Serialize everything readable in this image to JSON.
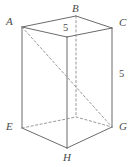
{
  "figure": {
    "type": "rectangular-prism-oblique-view",
    "vertices": [
      {
        "id": "A",
        "label": "A",
        "role": "top-left",
        "px": 22,
        "py": 27,
        "label_x": 6,
        "label_y": 16,
        "hidden": false
      },
      {
        "id": "B",
        "label": "B",
        "role": "top-back",
        "px": 76,
        "py": 16,
        "label_x": 72,
        "label_y": 3,
        "hidden": false
      },
      {
        "id": "C",
        "label": "C",
        "role": "top-right",
        "px": 112,
        "py": 28,
        "label_x": 119,
        "label_y": 17,
        "hidden": false
      },
      {
        "id": "D",
        "label": "",
        "role": "top-front",
        "px": 67,
        "py": 37,
        "label_x": 0,
        "label_y": 0,
        "hidden": false
      },
      {
        "id": "E",
        "label": "E",
        "role": "bottom-left",
        "px": 22,
        "py": 128,
        "label_x": 6,
        "label_y": 121,
        "hidden": false
      },
      {
        "id": "F",
        "label": "",
        "role": "bottom-back",
        "px": 76,
        "py": 117,
        "label_x": 0,
        "label_y": 0,
        "hidden": true
      },
      {
        "id": "G",
        "label": "G",
        "role": "bottom-right",
        "px": 112,
        "py": 127,
        "label_x": 119,
        "label_y": 121,
        "hidden": false
      },
      {
        "id": "H",
        "label": "H",
        "role": "bottom-front",
        "px": 67,
        "py": 148,
        "label_x": 63,
        "label_y": 152,
        "hidden": false
      }
    ],
    "solid_edges": [
      {
        "name": "edge-A-B",
        "from": "A",
        "to": "B"
      },
      {
        "name": "edge-B-C",
        "from": "B",
        "to": "C"
      },
      {
        "name": "edge-C-D",
        "from": "C",
        "to": "D"
      },
      {
        "name": "edge-D-A",
        "from": "D",
        "to": "A"
      },
      {
        "name": "edge-A-E",
        "from": "A",
        "to": "E"
      },
      {
        "name": "edge-C-G",
        "from": "C",
        "to": "G"
      },
      {
        "name": "edge-D-H",
        "from": "D",
        "to": "H"
      },
      {
        "name": "edge-E-H",
        "from": "E",
        "to": "H"
      },
      {
        "name": "edge-H-G",
        "from": "H",
        "to": "G"
      }
    ],
    "dashed_edges": [
      {
        "name": "hidden-edge-E-F",
        "from": "E",
        "to": "F"
      },
      {
        "name": "hidden-edge-F-G",
        "from": "F",
        "to": "G"
      },
      {
        "name": "hidden-edge-B-F",
        "from": "B",
        "to": "F"
      },
      {
        "name": "diagonal-A-G",
        "from": "A",
        "to": "G"
      }
    ],
    "measure_labels": [
      {
        "name": "top-edge-length",
        "text": "5",
        "x": 62,
        "y": 23
      },
      {
        "name": "side-edge-length",
        "text": "5",
        "x": 118,
        "y": 69
      }
    ]
  }
}
